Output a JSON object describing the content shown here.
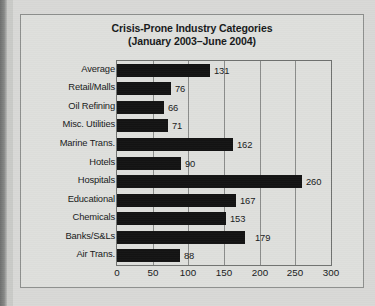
{
  "chart_data": {
    "type": "bar",
    "orientation": "horizontal",
    "title": "Crisis-Prone Industry Categories",
    "subtitle": "(January 2003–June 2004)",
    "xlabel": "",
    "ylabel": "",
    "xlim": [
      0,
      300
    ],
    "xticks": [
      0,
      50,
      100,
      150,
      200,
      250,
      300
    ],
    "xtick_labels": [
      "0",
      "50",
      "100",
      "150",
      "200",
      "250",
      "300"
    ],
    "grid": true,
    "grid_axis": "x",
    "legend": false,
    "bar_color": "#131313",
    "background_color": "#dedfdc",
    "categories": [
      "Average",
      "Retail/Malls",
      "Oil Refining",
      "Misc. Utilities",
      "Marine Trans.",
      "Hotels",
      "Hospitals",
      "Educational",
      "Chemicals",
      "Banks/S&Ls",
      "Air Trans."
    ],
    "values": [
      131,
      76,
      66,
      71,
      162,
      90,
      260,
      167,
      153,
      179,
      88
    ],
    "value_labels": [
      "131",
      "76",
      "66",
      "71",
      "162",
      "90",
      "260",
      "167",
      "153",
      "179",
      "88"
    ]
  }
}
